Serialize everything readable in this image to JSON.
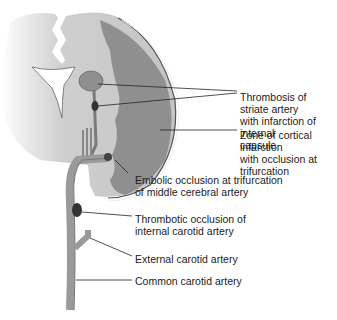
{
  "diagram": {
    "labels": [
      {
        "id": "striate",
        "text": "Thrombosis of striate artery\nwith infarction of internal\ncapsule"
      },
      {
        "id": "cortical",
        "text": "Zone of cortical infarction\nwith occlusion at trifurcation"
      },
      {
        "id": "embolic",
        "text": "Embolic occlusion at trifurcation\nof middle cerebral artery"
      },
      {
        "id": "thrombotic",
        "text": "Thrombotic occlusion of\ninternal carotid artery"
      },
      {
        "id": "external",
        "text": "External carotid artery"
      },
      {
        "id": "common",
        "text": "Common carotid artery"
      }
    ],
    "colors": {
      "brain_light": "#c8c8c8",
      "infarct_dark": "#8a8a8a",
      "artery": "#9a9a9a",
      "occlusion": "#3a3a3a",
      "ventricle": "#ffffff"
    }
  }
}
